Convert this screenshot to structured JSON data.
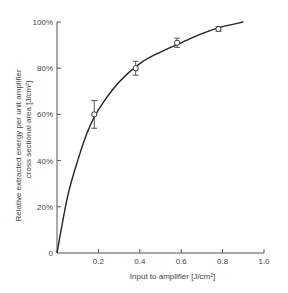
{
  "chart_data": {
    "type": "line",
    "title": "",
    "xlabel": "Input to amplifier [J/cm²]",
    "ylabel_line1": "Relative extracted energy per unit amplifier",
    "ylabel_line2": "cross sectional area [J/cm²]",
    "xlim": [
      0,
      1.0
    ],
    "ylim": [
      0,
      100
    ],
    "x_ticks": [
      0.2,
      0.4,
      0.6,
      0.8,
      1.0
    ],
    "x_tick_labels": [
      "0.2",
      "0.4",
      "0.6",
      "0.8",
      "1.0"
    ],
    "y_ticks": [
      0,
      20,
      40,
      60,
      80,
      100
    ],
    "y_tick_labels": [
      "0",
      "20%",
      "40%",
      "60%",
      "80%",
      "100%"
    ],
    "grid": false,
    "legend": null,
    "series": [
      {
        "name": "measured",
        "style": "open-circle markers with error bars",
        "x": [
          0.18,
          0.38,
          0.58,
          0.78
        ],
        "y": [
          60,
          80,
          91,
          97
        ],
        "error": [
          6,
          3,
          2,
          1
        ]
      },
      {
        "name": "fit curve",
        "style": "solid line",
        "x": [
          0,
          0.05,
          0.1,
          0.15,
          0.2,
          0.3,
          0.4,
          0.5,
          0.6,
          0.7,
          0.8,
          0.9
        ],
        "y": [
          0,
          24,
          40,
          53,
          62,
          74,
          82,
          87,
          91,
          95,
          98,
          100
        ]
      }
    ]
  }
}
